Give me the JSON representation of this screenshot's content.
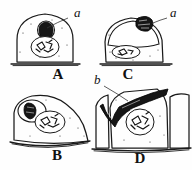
{
  "plate": {
    "title": "Cell stages plate",
    "background_color": "#fefefe",
    "ink_color": "#1a1a1a",
    "width": 192,
    "height": 170
  },
  "figures": [
    {
      "id": "A",
      "label": "A",
      "label_x": 58,
      "label_y": 79,
      "description": "Dome-shaped stippled cell on a basement line, with dark inclusion body a above an oval nucleus containing chromatin."
    },
    {
      "id": "B",
      "label": "B",
      "label_x": 57,
      "label_y": 160,
      "description": "Obliquely flattened stippled cell; dark inclusion body enclosed in a pale vacuole at upper left, nucleus with chromatin at centre."
    },
    {
      "id": "C",
      "label": "C",
      "label_x": 128,
      "label_y": 77,
      "description": "Rounded stippled cell with a large pale dome occupying the upper half, flattened nucleus below; dark body a resting on the apex."
    },
    {
      "id": "D",
      "label": "D",
      "label_x": 140,
      "label_y": 158,
      "description": "Columnar stippled cell between two neighbour cells; dark V-shaped intercellular mass b along the apical border, round nucleus with chromatin at centre."
    }
  ],
  "annotations": [
    {
      "id": "a-top-left",
      "label": "a",
      "label_x": 74,
      "label_y": 17,
      "target": "dark inclusion body in figure A",
      "leader": true
    },
    {
      "id": "a-top-right",
      "label": "a",
      "label_x": 172,
      "label_y": 17,
      "target": "dark body on apex of figure C",
      "leader": true
    },
    {
      "id": "b-middle",
      "label": "b",
      "label_x": 97,
      "label_y": 84,
      "target": "dark intercellular mass in figure D",
      "leader": true
    }
  ],
  "legend": {
    "a_meaning": "a",
    "b_meaning": "b"
  }
}
